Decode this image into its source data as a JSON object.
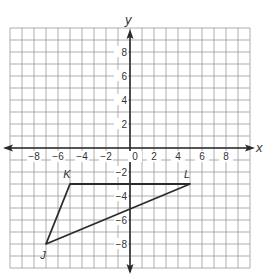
{
  "diagram": {
    "type": "coordinate-plane",
    "axes": {
      "x_label": "x",
      "y_label": "y",
      "range": {
        "xmin": -10,
        "xmax": 10,
        "ymin": -10,
        "ymax": 10
      },
      "grid_step": 1
    },
    "x_ticks": [
      {
        "value": -8,
        "label": "−8"
      },
      {
        "value": -6,
        "label": "−6"
      },
      {
        "value": -4,
        "label": "−4"
      },
      {
        "value": -2,
        "label": "−2"
      },
      {
        "value": 0,
        "label": "0"
      },
      {
        "value": 2,
        "label": "2"
      },
      {
        "value": 4,
        "label": "4"
      },
      {
        "value": 6,
        "label": "6"
      },
      {
        "value": 8,
        "label": "8"
      }
    ],
    "y_ticks": [
      {
        "value": 8,
        "label": "8"
      },
      {
        "value": 6,
        "label": "6"
      },
      {
        "value": 4,
        "label": "4"
      },
      {
        "value": 2,
        "label": "2"
      },
      {
        "value": -2,
        "label": "−2"
      },
      {
        "value": -4,
        "label": "−4"
      },
      {
        "value": -6,
        "label": "−6"
      },
      {
        "value": -8,
        "label": "−8"
      }
    ],
    "triangle": {
      "vertices": [
        {
          "name": "K",
          "x": -5,
          "y": -3
        },
        {
          "name": "L",
          "x": 5,
          "y": -3
        },
        {
          "name": "J",
          "x": -7,
          "y": -8
        }
      ]
    },
    "colors": {
      "grid": "#9a9a9a",
      "axis": "#2a2a2a",
      "triangle": "#2a2a2a",
      "text": "#333333"
    }
  }
}
